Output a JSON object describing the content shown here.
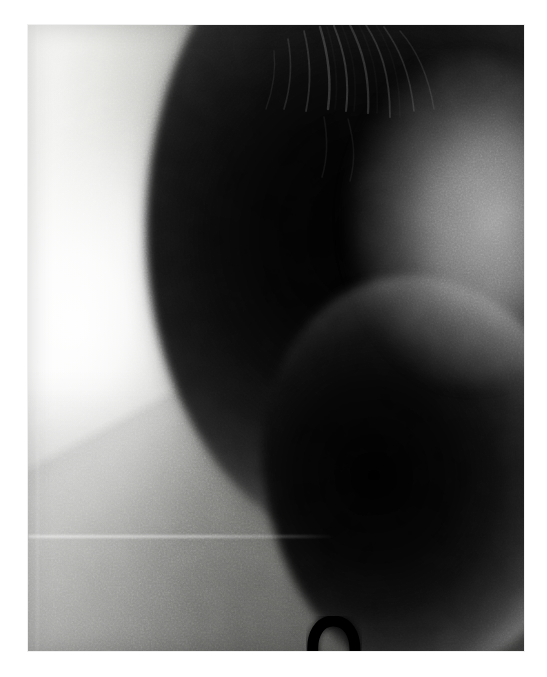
{
  "image": {
    "modality": "radiograph",
    "study_type": "barium contrast upper gastrointestinal study",
    "orientation": "frontal",
    "colorspace": "grayscale",
    "width_px": 547,
    "height_px": 677,
    "plate": {
      "left_px": 28,
      "top_px": 25,
      "width_px": 496,
      "height_px": 626,
      "background_color": "#9d9d9d",
      "border_color": "#ffffff"
    },
    "tones": {
      "lightest": "#f4f4f2",
      "light_soft_tissue": "#d8d8d5",
      "mid_grey": "#8c8c89",
      "dark_grey": "#3a3a3a",
      "contrast_filled": "#050505",
      "black": "#000000"
    },
    "regions": [
      {
        "name": "left-bright-field",
        "label": "Bright left soft-tissue / lung field",
        "tone": "#f4f4f2",
        "position": "left third, upper to mid"
      },
      {
        "name": "barium-filled-stomach",
        "label": "Dense barium-filled gastric lumen",
        "tone": "#050505",
        "position": "centre, occupying most of the frame"
      },
      {
        "name": "gastric-rugae",
        "label": "Mucosal fold (rugae) striations along the upper gastric margin",
        "tone": "#2a2a2a",
        "position": "upper centre-right"
      },
      {
        "name": "lesser-curve-incisura",
        "label": "Lighter concave notch along the lesser curvature",
        "tone": "#9a9a9a",
        "position": "right of centre"
      },
      {
        "name": "rib-band",
        "label": "Oblique radiodense rib shadow",
        "tone": "#a6a6a3",
        "position": "right upper quadrant, running diagonally"
      },
      {
        "name": "diaphragm-margin",
        "label": "Oblique soft-tissue margin",
        "tone": "#b9b9b6",
        "position": "lower left, diagonal"
      },
      {
        "name": "right-lower-dark-zone",
        "label": "Darker right-lower field",
        "tone": "#3c3c3c",
        "position": "right lower quadrant"
      },
      {
        "name": "scan-seam-line",
        "label": "Horizontal scanner seam artefact",
        "tone": "#e8e8e6",
        "position": "lower left, horizontal"
      }
    ],
    "device": {
      "name": "radiopaque-hook-device",
      "label": "Radiopaque hook / clip shaped device",
      "tone": "#000000",
      "position": "bottom centre",
      "x_px": 306,
      "y_px": 616,
      "width_px": 56,
      "height_px": 38
    },
    "annotations": [],
    "caption": ""
  }
}
